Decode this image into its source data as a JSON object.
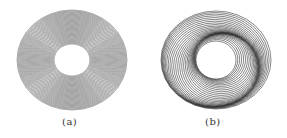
{
  "figures": [
    {
      "id": "a",
      "caption": "(a)",
      "type": "concentric-rings",
      "center": [
        72,
        60
      ],
      "outer_radius": [
        55,
        50
      ],
      "inner_radius": [
        18,
        16
      ],
      "ring_count": 40,
      "stroke_color": "#555555",
      "twist": 0
    },
    {
      "id": "b",
      "caption": "(b)",
      "type": "twisted-rings",
      "center": [
        216,
        60
      ],
      "outer_radius": [
        55,
        49
      ],
      "inner_radius": [
        20,
        19
      ],
      "ring_count": 30,
      "stroke_color": "#222222",
      "twist": 1
    }
  ]
}
